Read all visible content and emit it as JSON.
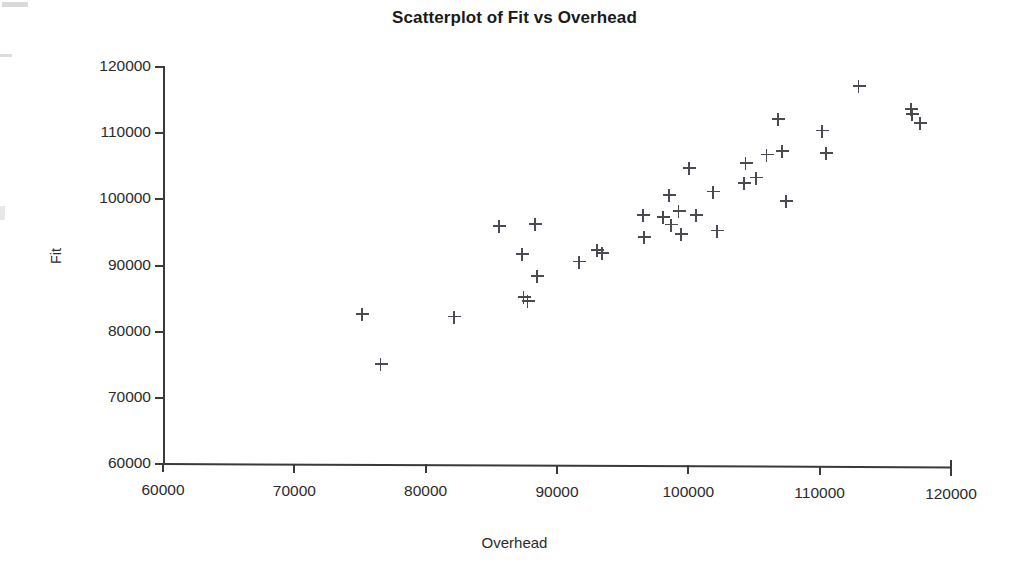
{
  "chart_data": {
    "type": "scatter",
    "title": "Scatterplot of Fit vs Overhead",
    "xlabel": "Overhead",
    "ylabel": "Fit",
    "xlim": [
      60000,
      120000
    ],
    "ylim": [
      60000,
      120000
    ],
    "xticks": [
      60000,
      70000,
      80000,
      90000,
      100000,
      110000,
      120000
    ],
    "yticks": [
      60000,
      70000,
      80000,
      90000,
      100000,
      110000,
      120000
    ],
    "xtick_labels": [
      "60000",
      "70000",
      "80000",
      "90000",
      "100000",
      "110000",
      "120000"
    ],
    "ytick_labels": [
      "60000",
      "70000",
      "80000",
      "90000",
      "100000",
      "110000",
      "120000"
    ],
    "grid": false,
    "legend": false,
    "marker": "plus",
    "marker_color": "#4a4a52",
    "series": [
      {
        "name": "Fit vs Overhead",
        "points": [
          [
            75200,
            82600
          ],
          [
            76600,
            75000
          ],
          [
            82200,
            82200
          ],
          [
            85600,
            95900
          ],
          [
            87400,
            91600
          ],
          [
            87500,
            85200
          ],
          [
            87800,
            84500
          ],
          [
            88400,
            96200
          ],
          [
            88500,
            88300
          ],
          [
            91700,
            90500
          ],
          [
            93100,
            92300
          ],
          [
            93500,
            91800
          ],
          [
            96600,
            97500
          ],
          [
            96700,
            94200
          ],
          [
            98100,
            97200
          ],
          [
            98600,
            100600
          ],
          [
            98700,
            96100
          ],
          [
            99300,
            98100
          ],
          [
            99500,
            94700
          ],
          [
            100100,
            104600
          ],
          [
            100600,
            97600
          ],
          [
            101900,
            101100
          ],
          [
            102200,
            95200
          ],
          [
            104300,
            102400
          ],
          [
            104400,
            105400
          ],
          [
            105200,
            103200
          ],
          [
            106000,
            106700
          ],
          [
            106900,
            112100
          ],
          [
            107200,
            107200
          ],
          [
            107500,
            99700
          ],
          [
            110200,
            110300
          ],
          [
            110500,
            106900
          ],
          [
            113000,
            117000
          ],
          [
            117000,
            113600
          ],
          [
            117100,
            112800
          ],
          [
            117700,
            111400
          ]
        ]
      }
    ]
  },
  "axis_titles": {
    "x": "Overhead",
    "y": "Fit"
  },
  "title": "Scatterplot of Fit vs Overhead"
}
